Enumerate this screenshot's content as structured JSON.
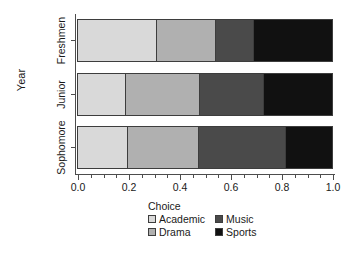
{
  "chart_data": {
    "type": "bar",
    "orientation": "horizontal",
    "stacked": true,
    "normalized": true,
    "title": "",
    "xlabel": "",
    "ylabel": "Year",
    "xlim": [
      0.0,
      1.0
    ],
    "grid": false,
    "legend_position": "bottom",
    "legend_title": "Choice",
    "categories": [
      "Sophomore",
      "Junior",
      "Freshmen"
    ],
    "display_order_top_to_bottom": [
      "Freshmen",
      "Junior",
      "Sophomore"
    ],
    "x_tick_labels": [
      "0.0",
      "0.2",
      "0.4",
      "0.6",
      "0.8",
      "1.0"
    ],
    "x_tick_values": [
      0.0,
      0.2,
      0.4,
      0.6,
      0.8,
      1.0
    ],
    "x_minor_tick_step": 0.05,
    "series": [
      {
        "name": "Academic",
        "color": "#d9d9d9",
        "values": [
          0.195,
          0.19,
          0.31
        ]
      },
      {
        "name": "Drama",
        "color": "#b0b0b0",
        "values": [
          0.28,
          0.29,
          0.23
        ]
      },
      {
        "name": "Music",
        "color": "#4a4a4a",
        "values": [
          0.34,
          0.25,
          0.15
        ]
      },
      {
        "name": "Sports",
        "color": "#111111",
        "values": [
          0.185,
          0.27,
          0.31
        ]
      }
    ],
    "cumulative_boundaries": {
      "Freshmen": [
        0.31,
        0.54,
        0.69,
        1.0
      ],
      "Junior": [
        0.19,
        0.48,
        0.73,
        1.0
      ],
      "Sophomore": [
        0.195,
        0.475,
        0.815,
        1.0
      ]
    }
  },
  "axis": {
    "y_title": "Year",
    "y_labels": [
      "Freshmen",
      "Junior",
      "Sophomore"
    ]
  },
  "legend": {
    "title": "Choice",
    "column_left": [
      {
        "label": "Academic",
        "color": "#d9d9d9"
      },
      {
        "label": "Drama",
        "color": "#b0b0b0"
      }
    ],
    "column_right": [
      {
        "label": "Music",
        "color": "#4a4a4a"
      },
      {
        "label": "Sports",
        "color": "#111111"
      }
    ]
  }
}
